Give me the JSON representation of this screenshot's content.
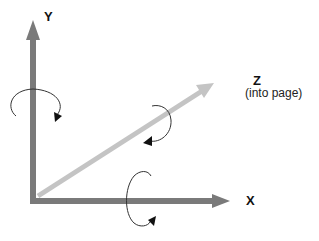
{
  "diagram": {
    "type": "3d-coordinate-axes-rotation",
    "axes": [
      {
        "name": "y-axis",
        "label": "Y",
        "color": "#7a7a7a",
        "rotation_arrow": "counter-clockwise around vertical axis"
      },
      {
        "name": "x-axis",
        "label": "X",
        "color": "#7a7a7a",
        "rotation_arrow": "around horizontal axis"
      },
      {
        "name": "z-axis",
        "label": "Z",
        "sublabel": "(into page)",
        "color": "#c4c4c4",
        "rotation_arrow": "around diagonal axis"
      }
    ]
  },
  "labels": {
    "y": "Y",
    "x": "X",
    "z": "Z",
    "z_sub": "(into page)"
  },
  "colors": {
    "xy_axis": "#7a7a7a",
    "z_axis": "#c4c4c4",
    "rotation_curve": "#333333",
    "rotation_head": "#111111"
  }
}
